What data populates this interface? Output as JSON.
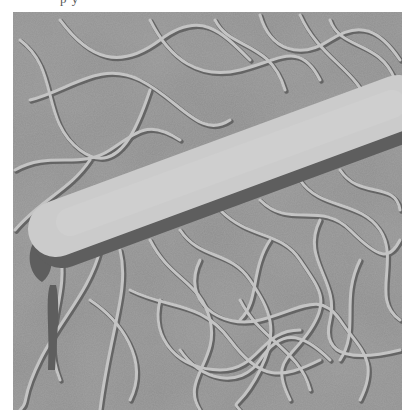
{
  "page": {
    "caption_fragment": "p    y"
  },
  "micrograph": {
    "subject": "rod-shaped bacterium with peritrichous flagella",
    "style": "grayscale shadow-cast electron micrograph",
    "colors": {
      "background": "#8f8f8f",
      "background_dark": "#6d6d6d",
      "cell_body": "#cbcbcb",
      "cell_shadow": "#5e5e5e",
      "flagella": "#c2c2c2",
      "flagella_shadow": "#5a5a5a"
    },
    "cell": {
      "start": [
        52,
        228
      ],
      "end": [
        400,
        100
      ],
      "thickness": 56
    }
  }
}
